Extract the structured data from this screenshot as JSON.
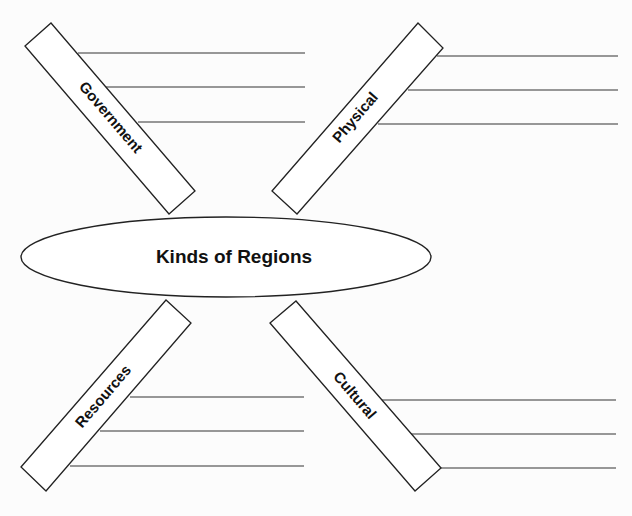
{
  "diagram": {
    "center": {
      "label": "Kinds of Regions"
    },
    "branches": [
      {
        "id": "government",
        "label": "Government",
        "position": "top-left",
        "blank_lines": 3
      },
      {
        "id": "physical",
        "label": "Physical",
        "position": "top-right",
        "blank_lines": 3
      },
      {
        "id": "resources",
        "label": "Resources",
        "position": "bottom-left",
        "blank_lines": 3
      },
      {
        "id": "cultural",
        "label": "Cultural",
        "position": "bottom-right",
        "blank_lines": 3
      }
    ]
  },
  "colors": {
    "ink": "#222222",
    "paper": "#fcfcfc"
  }
}
